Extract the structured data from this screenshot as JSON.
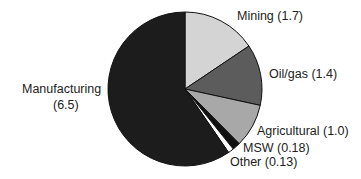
{
  "chart_data": {
    "type": "pie",
    "title": "",
    "start_angle_deg": 0,
    "direction": "clockwise",
    "slices": [
      {
        "label": "Mining",
        "value": 1.7,
        "color": "#d4d4d4"
      },
      {
        "label": "Oil/gas",
        "value": 1.4,
        "color": "#5c5c5c"
      },
      {
        "label": "Agricultural",
        "value": 1.0,
        "color": "#a8a8a8"
      },
      {
        "label": "MSW",
        "value": 0.18,
        "color": "#111111"
      },
      {
        "label": "Other",
        "value": 0.13,
        "color": "#ffffff"
      },
      {
        "label": "Manufacturing",
        "value": 6.5,
        "color": "#1c1c1c"
      }
    ]
  },
  "labels": {
    "mining": "Mining (1.7)",
    "oilgas": "Oil/gas (1.4)",
    "agricultural": "Agricultural (1.0)",
    "msw": "MSW (0.18)",
    "other": "Other (0.13)",
    "manufacturing_1": "Manufacturing",
    "manufacturing_2": "(6.5)"
  }
}
